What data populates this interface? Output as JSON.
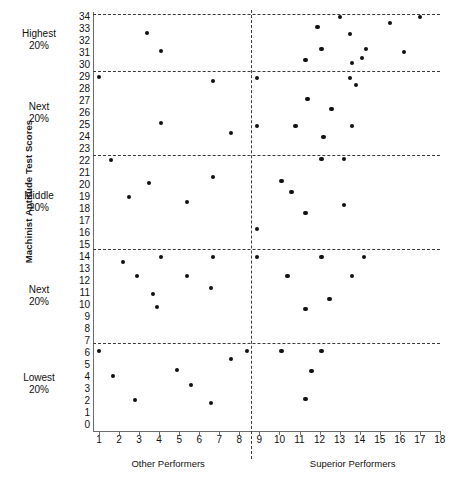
{
  "chart_data": {
    "type": "scatter",
    "title": "",
    "ylabel": "Machinist Aptitude Test Scores",
    "xlabel": "",
    "xlim": [
      0.3,
      18.7
    ],
    "ylim": [
      0,
      34.6
    ],
    "grid": false,
    "legend": "none",
    "y_ticks": [
      34,
      33,
      32,
      31,
      30,
      29,
      28,
      27,
      26,
      25,
      24,
      23,
      22,
      21,
      20,
      19,
      18,
      17,
      16,
      15,
      14,
      13,
      12,
      11,
      10,
      9,
      8,
      7,
      6,
      5,
      4,
      3,
      2,
      1,
      0
    ],
    "x_ticks": [
      1,
      2,
      3,
      4,
      5,
      6,
      7,
      8,
      9,
      10,
      11,
      12,
      13,
      14,
      15,
      16,
      17,
      18
    ],
    "band_dividers": [
      29.5,
      22.5,
      14.7,
      6.8
    ],
    "vertical_divider_x": 8.6,
    "band_labels": [
      {
        "line1": "Highest",
        "line2": "20%"
      },
      {
        "line1": "Next",
        "line2": "20%"
      },
      {
        "line1": "Middle",
        "line2": "20%"
      },
      {
        "line1": "Next",
        "line2": "20%"
      },
      {
        "line1": "Lowest",
        "line2": "20%"
      }
    ],
    "group_captions": [
      {
        "label": "Other Performers"
      },
      {
        "label": "Superior Performers"
      }
    ],
    "series": [
      {
        "name": "Other Performers",
        "points": [
          [
            3.4,
            32.7
          ],
          [
            4.1,
            31.2
          ],
          [
            1.0,
            29.0
          ],
          [
            6.7,
            28.7
          ],
          [
            4.1,
            25.2
          ],
          [
            7.6,
            24.3
          ],
          [
            1.6,
            22.1
          ],
          [
            6.7,
            20.7
          ],
          [
            3.5,
            20.2
          ],
          [
            2.5,
            19.0
          ],
          [
            5.4,
            18.6
          ],
          [
            4.1,
            14.0
          ],
          [
            6.7,
            14.0
          ],
          [
            2.2,
            13.6
          ],
          [
            2.9,
            12.4
          ],
          [
            5.4,
            12.4
          ],
          [
            6.6,
            11.4
          ],
          [
            3.7,
            10.9
          ],
          [
            3.9,
            9.8
          ],
          [
            1.0,
            6.2
          ],
          [
            8.4,
            6.2
          ],
          [
            7.6,
            5.5
          ],
          [
            4.9,
            4.6
          ],
          [
            1.7,
            4.1
          ],
          [
            5.6,
            3.3
          ],
          [
            2.8,
            2.1
          ],
          [
            6.6,
            1.8
          ]
        ]
      },
      {
        "name": "Superior Performers",
        "points": [
          [
            13.0,
            34.0
          ],
          [
            17.0,
            34.0
          ],
          [
            15.5,
            33.5
          ],
          [
            11.9,
            33.2
          ],
          [
            13.5,
            32.6
          ],
          [
            12.1,
            31.3
          ],
          [
            14.3,
            31.3
          ],
          [
            14.1,
            30.6
          ],
          [
            16.2,
            31.1
          ],
          [
            13.6,
            30.2
          ],
          [
            11.3,
            30.4
          ],
          [
            8.9,
            28.9
          ],
          [
            13.5,
            28.9
          ],
          [
            13.8,
            28.3
          ],
          [
            11.4,
            27.2
          ],
          [
            12.6,
            26.3
          ],
          [
            8.9,
            24.9
          ],
          [
            10.8,
            24.9
          ],
          [
            13.6,
            24.9
          ],
          [
            12.2,
            24.0
          ],
          [
            12.1,
            22.2
          ],
          [
            13.2,
            22.2
          ],
          [
            10.1,
            20.3
          ],
          [
            10.6,
            19.4
          ],
          [
            13.2,
            18.3
          ],
          [
            11.3,
            17.7
          ],
          [
            8.9,
            16.3
          ],
          [
            8.9,
            14.0
          ],
          [
            12.1,
            14.0
          ],
          [
            14.2,
            14.0
          ],
          [
            10.4,
            12.4
          ],
          [
            13.6,
            12.4
          ],
          [
            12.5,
            10.5
          ],
          [
            11.3,
            9.7
          ],
          [
            10.1,
            6.2
          ],
          [
            12.1,
            6.2
          ],
          [
            11.6,
            4.5
          ],
          [
            11.3,
            2.2
          ]
        ]
      }
    ]
  }
}
